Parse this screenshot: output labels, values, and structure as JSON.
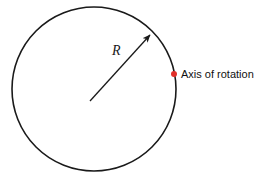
{
  "figure": {
    "background_color": "#ffffff",
    "width": 271,
    "height": 183
  },
  "circle": {
    "name": "disc-outline",
    "center_x": 94,
    "center_y": 89,
    "radius": 82,
    "stroke_color": "#1a1a1a",
    "stroke_width": 1.6,
    "fill": "none"
  },
  "radius_arrow": {
    "label": "R",
    "label_x": 112,
    "label_y": 55,
    "from_x": 90,
    "from_y": 101,
    "to_x": 150,
    "to_y": 35,
    "stroke_color": "#1a1a1a",
    "stroke_width": 1.3
  },
  "axis_marker": {
    "label": "Axis of rotation",
    "dot_x": 174,
    "dot_y": 74,
    "dot_radius": 3,
    "dot_color": "#e1302a",
    "label_x": 181,
    "label_y": 78,
    "label_color": "#111111"
  }
}
